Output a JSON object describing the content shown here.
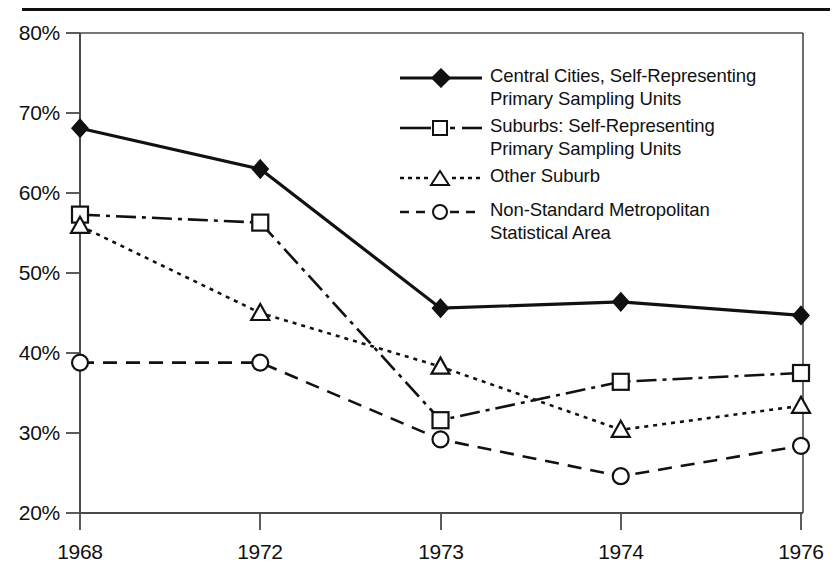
{
  "chart_data": {
    "type": "line",
    "title": "",
    "xlabel": "",
    "ylabel": "",
    "categories": [
      "1968",
      "1972",
      "1973",
      "1974",
      "1976"
    ],
    "ylim": [
      20,
      80
    ],
    "ytick_labels": [
      "20%",
      "30%",
      "40%",
      "50%",
      "60%",
      "70%",
      "80%"
    ],
    "ytick_values": [
      20,
      30,
      40,
      50,
      60,
      70,
      80
    ],
    "grid": false,
    "legend_position": "upper right",
    "series": [
      {
        "name": "Central Cities, Self-Representing Primary Sampling Units",
        "marker": "filled-diamond",
        "linestyle": "solid",
        "values": [
          68.1,
          63.0,
          45.6,
          46.4,
          44.7
        ]
      },
      {
        "name": "Suburbs: Self-Representing Primary Sampling Units",
        "marker": "open-square",
        "linestyle": "dash-dot",
        "values": [
          57.3,
          56.3,
          31.6,
          36.4,
          37.5
        ]
      },
      {
        "name": "Other Suburb",
        "marker": "open-triangle",
        "linestyle": "dotted",
        "values": [
          55.9,
          45.0,
          38.3,
          30.4,
          33.4
        ]
      },
      {
        "name": "Non-Standard Metropolitan Statistical Area",
        "marker": "open-circle",
        "linestyle": "dashed",
        "values": [
          38.8,
          38.8,
          29.2,
          24.6,
          28.4
        ]
      }
    ]
  },
  "legend": {
    "items": [
      {
        "label_line1": "Central Cities, Self-Representing",
        "label_line2": "Primary Sampling Units"
      },
      {
        "label_line1": "Suburbs: Self-Representing",
        "label_line2": "Primary Sampling Units"
      },
      {
        "label_line1": "Other Suburb",
        "label_line2": ""
      },
      {
        "label_line1": "Non-Standard Metropolitan",
        "label_line2": "Statistical Area"
      }
    ]
  },
  "colors": {
    "ink": "#111111",
    "axis": "#3a3a3a",
    "background": "#ffffff"
  }
}
